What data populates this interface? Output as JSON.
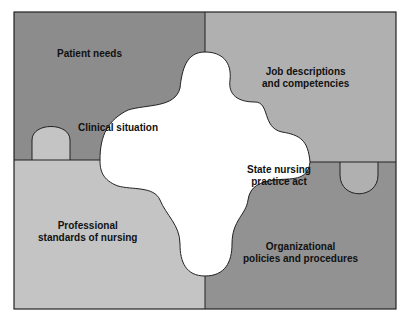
{
  "diagram": {
    "type": "puzzle",
    "colors": {
      "top_left": "#8c8c8c",
      "top_right": "#b0b0b0",
      "bottom_left": "#c4c4c4",
      "bottom_right": "#929292",
      "center": "#ffffff",
      "outline": "#222222"
    },
    "pieces": {
      "top_left": "Patient needs",
      "top_right_line1": "Job descriptions",
      "top_right_line2": "and competencies",
      "bottom_left_line1": "Professional",
      "bottom_left_line2": "standards of nursing",
      "bottom_right_line1": "Organizational",
      "bottom_right_line2": "policies and procedures"
    },
    "center": {
      "label_left": "Clinical situation",
      "label_right_line1": "State nursing",
      "label_right_line2": "practice act"
    }
  }
}
